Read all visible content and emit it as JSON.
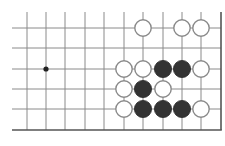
{
  "board": {
    "title": "Go board diagram (lower-right corner section)",
    "colors": {
      "background": "#ffffff",
      "grid_line": "#8a8a8a",
      "edge_line": "#555555",
      "black_stone": "#333333",
      "white_stone_fill": "#ffffff",
      "white_stone_stroke": "#8a8a8a",
      "star_point": "#222222"
    },
    "columns_x": [
      27,
      46,
      65,
      85,
      104,
      124,
      143,
      163,
      182,
      201
    ],
    "rows_y": [
      28,
      48,
      69,
      89,
      109
    ],
    "edge_right_x": 221,
    "edge_bottom_y": 130,
    "grid_top_y": 12,
    "grid_left_x": 12,
    "star_points": [
      {
        "col": 1,
        "row": 2
      }
    ],
    "stones": [
      {
        "color": "white",
        "col": 6,
        "row": 0
      },
      {
        "color": "white",
        "col": 8,
        "row": 0
      },
      {
        "color": "white",
        "col": 9,
        "row": 0
      },
      {
        "color": "white",
        "col": 5,
        "row": 2
      },
      {
        "color": "white",
        "col": 6,
        "row": 2
      },
      {
        "color": "black",
        "col": 7,
        "row": 2
      },
      {
        "color": "black",
        "col": 8,
        "row": 2
      },
      {
        "color": "white",
        "col": 9,
        "row": 2
      },
      {
        "color": "white",
        "col": 5,
        "row": 3
      },
      {
        "color": "black",
        "col": 6,
        "row": 3
      },
      {
        "color": "white",
        "col": 7,
        "row": 3
      },
      {
        "color": "white",
        "col": 5,
        "row": 4
      },
      {
        "color": "black",
        "col": 6,
        "row": 4
      },
      {
        "color": "black",
        "col": 7,
        "row": 4
      },
      {
        "color": "black",
        "col": 8,
        "row": 4
      },
      {
        "color": "white",
        "col": 9,
        "row": 4
      }
    ]
  }
}
